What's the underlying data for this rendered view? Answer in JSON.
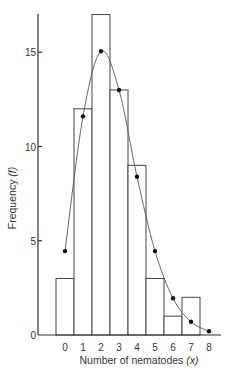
{
  "chart_data": {
    "type": "bar",
    "title": "",
    "xlabel": "Number of nematodes (x)",
    "ylabel": "Frequency (f)",
    "categories": [
      "0",
      "1",
      "2",
      "3",
      "4",
      "5",
      "6",
      "7",
      "8"
    ],
    "ylim": [
      0,
      17
    ],
    "yticks": [
      0,
      5,
      10,
      15
    ],
    "grid": false,
    "legend": null,
    "series": [
      {
        "name": "Observed frequency",
        "type": "bar",
        "values": [
          3,
          12,
          17,
          13,
          9,
          3,
          1,
          2,
          0
        ]
      },
      {
        "name": "Expected frequency (fitted curve)",
        "type": "line",
        "markers": true,
        "values": [
          4.45,
          11.6,
          15.05,
          13.0,
          8.4,
          4.45,
          1.95,
          0.7,
          0.2
        ]
      }
    ]
  },
  "axes": {
    "xlabel_main": "Number of nematodes ",
    "xlabel_var": "(x)",
    "ylabel_main": "Frequency ",
    "ylabel_var": "(f)",
    "ytick_labels": [
      "0",
      "5",
      "10",
      "15"
    ],
    "xtick_labels": [
      "0",
      "1",
      "2",
      "3",
      "4",
      "5",
      "6",
      "7",
      "8"
    ]
  }
}
